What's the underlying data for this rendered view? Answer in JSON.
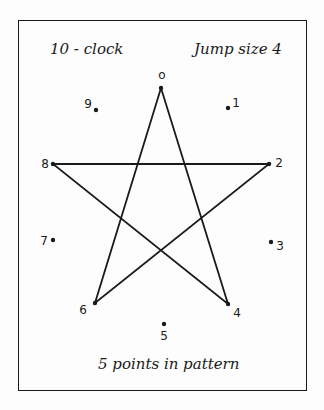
{
  "title_left": "10 - clock",
  "title_right": "Jump size 4",
  "caption": "5 points in pattern",
  "points": [
    {
      "label": "0",
      "x": 161,
      "y": 88,
      "lx": 162,
      "ly": 75
    },
    {
      "label": "1",
      "x": 228,
      "y": 108,
      "lx": 236,
      "ly": 103
    },
    {
      "label": "2",
      "x": 269,
      "y": 164,
      "lx": 279,
      "ly": 163
    },
    {
      "label": "3",
      "x": 271,
      "y": 242,
      "lx": 280,
      "ly": 246
    },
    {
      "label": "4",
      "x": 228,
      "y": 304,
      "lx": 237,
      "ly": 313
    },
    {
      "label": "5",
      "x": 164,
      "y": 324,
      "lx": 164,
      "ly": 336
    },
    {
      "label": "6",
      "x": 95,
      "y": 303,
      "lx": 83,
      "ly": 310
    },
    {
      "label": "7",
      "x": 53,
      "y": 240,
      "lx": 44,
      "ly": 241
    },
    {
      "label": "8",
      "x": 53,
      "y": 164,
      "lx": 45,
      "ly": 164
    },
    {
      "label": "9",
      "x": 96,
      "y": 110,
      "lx": 88,
      "ly": 104
    }
  ],
  "pattern": [
    0,
    4,
    8,
    2,
    6,
    0
  ],
  "colors": {
    "ink": "#1a1a1a",
    "paper": "#fdfdfd"
  }
}
